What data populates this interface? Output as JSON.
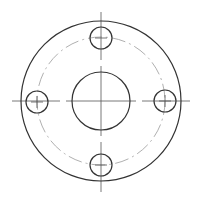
{
  "drawing": {
    "type": "flange-top-view",
    "center": [
      101,
      101
    ],
    "outer_circle": {
      "r": 80,
      "color": "#333333"
    },
    "bolt_circle": {
      "r": 64,
      "color": "#aaaaaa",
      "style": "dash-dot"
    },
    "center_hole": {
      "r": 29,
      "color": "#333333"
    },
    "bolt_holes": [
      {
        "cx": 101,
        "cy": 38,
        "r": 11
      },
      {
        "cx": 37,
        "cy": 102,
        "r": 11
      },
      {
        "cx": 165,
        "cy": 101,
        "r": 11
      },
      {
        "cx": 101,
        "cy": 165,
        "r": 11
      }
    ],
    "centerline_color": "#555555"
  }
}
